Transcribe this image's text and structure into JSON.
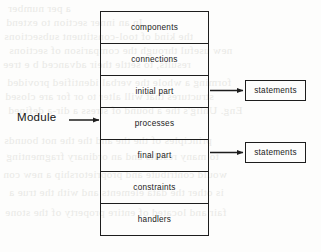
{
  "figure": {
    "caption_label": "Module",
    "module_rows": [
      {
        "label": "components"
      },
      {
        "label": "connections"
      },
      {
        "label": "initial  part"
      },
      {
        "label": "processes"
      },
      {
        "label": "final  part"
      },
      {
        "label": "constraints"
      },
      {
        "label": "handlers"
      }
    ],
    "side_boxes": [
      {
        "label": "statements",
        "from_row": "initial  part"
      },
      {
        "label": "statements",
        "from_row": "final  part"
      }
    ],
    "colors": {
      "stroke": "#1d1d1d",
      "text": "#1a1a1a",
      "background": "#fdfdfc",
      "bleed_text": "#e9e9e6"
    }
  },
  "background_bleed": {
    "note": "faint mirrored show-through text from the reverse page",
    "lines": [
      "a per number",
      "In an inner section to extend",
      "the kind of tool-constituent subsections",
      "new useful through the comparison of sections",
      "results, to settle their advanced b e tree",
      "forming a whole the verbal identified provided",
      "structures that will alter to or for are closed",
      "Eng. Uhlig's the a bound of stress a dir-a defined",
      "principles of the the and the the not bounds",
      "to many results and an ordinary fragmenting",
      "would contribute and proprietorship a new con",
      "is other the data elements and with the true a",
      "fair and located of entire property of the stone"
    ]
  }
}
